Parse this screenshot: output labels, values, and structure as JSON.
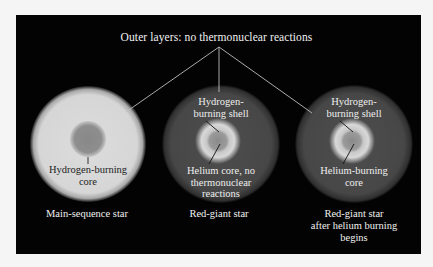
{
  "diagram": {
    "title": "Outer layers: no thermonuclear reactions",
    "colors": {
      "background": "#f5f5f5",
      "panel": "#030303",
      "main_sequence_envelope": "#d9d9d9",
      "main_sequence_core": "#8c8c8c",
      "red_giant_envelope": "#4a4a4a",
      "shell": "#d4d4d4",
      "core": "#8f8f8f",
      "pointer_line": "#bdbdbd"
    },
    "stars": [
      {
        "id": "main-sequence",
        "caption_lines": [
          "Main-sequence star"
        ],
        "labels": [
          {
            "lines": [
              "Hydrogen-burning",
              "core"
            ]
          }
        ]
      },
      {
        "id": "red-giant",
        "caption_lines": [
          "Red-giant star"
        ],
        "labels": [
          {
            "lines": [
              "Hydrogen-",
              "burning shell"
            ]
          },
          {
            "lines": [
              "Helium core, no",
              "thermonuclear",
              "reactions"
            ]
          }
        ]
      },
      {
        "id": "red-giant-helium",
        "caption_lines": [
          "Red-giant star",
          "after helium burning",
          "begins"
        ],
        "labels": [
          {
            "lines": [
              "Hydrogen-",
              "burning shell"
            ]
          },
          {
            "lines": [
              "Helium-burning",
              "core"
            ]
          }
        ]
      }
    ]
  }
}
